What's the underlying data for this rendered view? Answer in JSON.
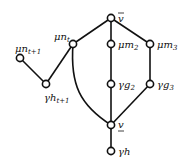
{
  "diagram": {
    "type": "lattice-graph",
    "nodes": [
      {
        "id": "vbar",
        "label": "v̄",
        "x": 111,
        "y": 18
      },
      {
        "id": "mu_nt",
        "label": "μn",
        "sub": "t",
        "x": 73,
        "y": 44
      },
      {
        "id": "mu_m2",
        "label": "μm",
        "sub": "2",
        "x": 111,
        "y": 44
      },
      {
        "id": "mu_m3",
        "label": "μm",
        "sub": "3",
        "x": 150,
        "y": 44
      },
      {
        "id": "mu_nt1",
        "label": "μn",
        "sub": "t+1",
        "x": 20,
        "y": 58
      },
      {
        "id": "gamma_ht1",
        "label": "γh",
        "sub": "t+1",
        "x": 46,
        "y": 84
      },
      {
        "id": "gamma_g2",
        "label": "γg",
        "sub": "2",
        "x": 111,
        "y": 84
      },
      {
        "id": "gamma_g3",
        "label": "γg",
        "sub": "3",
        "x": 150,
        "y": 84
      },
      {
        "id": "vunder",
        "label": "v̲",
        "x": 111,
        "y": 125
      },
      {
        "id": "gamma_h",
        "label": "γh",
        "x": 111,
        "y": 151
      }
    ],
    "edges": [
      [
        "vbar",
        "mu_nt"
      ],
      [
        "vbar",
        "mu_m2"
      ],
      [
        "vbar",
        "mu_m3"
      ],
      [
        "mu_m2",
        "gamma_g2"
      ],
      [
        "mu_m3",
        "gamma_g3"
      ],
      [
        "gamma_g2",
        "vunder"
      ],
      [
        "gamma_g3",
        "vunder"
      ],
      [
        "mu_nt",
        "vunder"
      ],
      [
        "mu_nt",
        "gamma_ht1"
      ],
      [
        "gamma_ht1",
        "mu_nt1"
      ],
      [
        "vunder",
        "gamma_h"
      ]
    ]
  },
  "labels": {
    "vbar": "v",
    "mu_nt": "μn",
    "mu_nt_sub": "t",
    "mu_m2": "μm",
    "mu_m2_sub": "2",
    "mu_m3": "μm",
    "mu_m3_sub": "3",
    "mu_nt1": "μn",
    "mu_nt1_sub": "t+1",
    "gamma_ht1": "γh",
    "gamma_ht1_sub": "t+1",
    "gamma_g2": "γg",
    "gamma_g2_sub": "2",
    "gamma_g3": "γg",
    "gamma_g3_sub": "3",
    "vunder": "v",
    "gamma_h": "γh"
  }
}
